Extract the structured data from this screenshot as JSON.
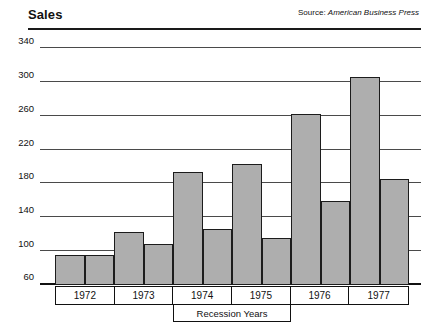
{
  "header": {
    "title": "Sales",
    "source_label": "Source:",
    "source_value": "American Business Press"
  },
  "axis": {
    "recession_label": "Recession Years"
  },
  "chart_data": {
    "type": "bar",
    "title": "Sales",
    "subtitle": "",
    "xlabel": "",
    "ylabel": "",
    "categories": [
      "1972",
      "1973",
      "1974",
      "1975",
      "1976",
      "1977"
    ],
    "series": [
      {
        "name": "bar-a",
        "values": [
          95,
          123,
          193,
          203,
          262,
          306
        ]
      },
      {
        "name": "bar-b",
        "values": [
          95,
          108,
          126,
          115,
          159,
          185
        ]
      }
    ],
    "ylim": [
      60,
      340
    ],
    "yticks": [
      340,
      300,
      260,
      220,
      180,
      140,
      100,
      60
    ],
    "ytick_labels": [
      "340",
      "300",
      "260",
      "220",
      "180",
      "140",
      "100",
      "60"
    ],
    "grid": true,
    "legend": "none",
    "annotations": [
      {
        "text": "Recession Years",
        "spans": [
          "1974",
          "1975"
        ]
      },
      {
        "text": "Source: American Business Press",
        "position": "top-right"
      }
    ],
    "bar_color": "#aeaeae",
    "bar_edge_color": "#1c1c1c",
    "grid_color": "#4a4a4a"
  }
}
